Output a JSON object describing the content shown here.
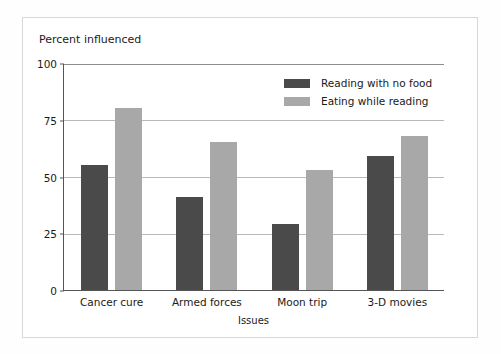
{
  "chart_data": {
    "type": "bar",
    "title": "",
    "xlabel": "Issues",
    "ylabel": "Percent influenced",
    "categories": [
      "Cancer cure",
      "Armed forces",
      "Moon trip",
      "3-D movies"
    ],
    "series": [
      {
        "name": "Reading with no food",
        "color": "#4a4a4a",
        "values": [
          55,
          41,
          29,
          59
        ]
      },
      {
        "name": "Eating while reading",
        "color": "#a8a8a8",
        "values": [
          80,
          65,
          53,
          68
        ]
      }
    ],
    "ylim": [
      0,
      100
    ],
    "yticks": [
      0,
      25,
      50,
      75,
      100
    ],
    "ytick_labels": [
      "0",
      "25",
      "50",
      "75",
      "100"
    ],
    "grid": true,
    "legend_position": "top-right"
  },
  "colors": {
    "series_dark": "#4a4a4a",
    "series_light": "#a8a8a8",
    "axis": "#555555",
    "gridline": "#b9b9b9",
    "card_background": "#ffffff",
    "page_background": "#fefefe"
  }
}
